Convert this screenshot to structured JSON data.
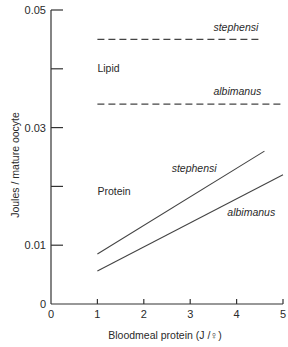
{
  "chart_data": {
    "type": "line",
    "title": "",
    "xlabel": "Bloodmeal protein (J /♀)",
    "ylabel": "Joules / mature oocyte",
    "xlim": [
      0,
      5
    ],
    "ylim": [
      0,
      0.05
    ],
    "x_ticks": [
      0,
      1,
      2,
      3,
      4,
      5
    ],
    "x_tick_labels": [
      "0",
      "1",
      "2",
      "3",
      "4",
      "5"
    ],
    "y_ticks": [
      0,
      0.01,
      0.02,
      0.03,
      0.04,
      0.05
    ],
    "y_tick_labels": [
      "0",
      "0.01",
      "",
      "0.03",
      "",
      "0.05"
    ],
    "grid": false,
    "legend": null,
    "series": [
      {
        "name": "Lipid - stephensi",
        "group": "Lipid",
        "species": "stephensi",
        "style": "dashed",
        "x": [
          1,
          4.5
        ],
        "values": [
          0.045,
          0.045
        ]
      },
      {
        "name": "Lipid - albimanus",
        "group": "Lipid",
        "species": "albimanus",
        "style": "dashed",
        "x": [
          1,
          5
        ],
        "values": [
          0.034,
          0.034
        ]
      },
      {
        "name": "Protein - stephensi",
        "group": "Protein",
        "species": "stephensi",
        "style": "solid",
        "x": [
          1,
          4.6
        ],
        "values": [
          0.0085,
          0.026
        ]
      },
      {
        "name": "Protein - albimanus",
        "group": "Protein",
        "species": "albimanus",
        "style": "solid",
        "x": [
          1,
          5
        ],
        "values": [
          0.0056,
          0.022
        ]
      }
    ],
    "annotations": [
      {
        "text": "stephensi",
        "italic": true,
        "x": 3.5,
        "y": 0.0465
      },
      {
        "text": "Lipid",
        "italic": false,
        "x": 1.0,
        "y": 0.0395
      },
      {
        "text": "albimanus",
        "italic": true,
        "x": 3.5,
        "y": 0.0355
      },
      {
        "text": "stephensi",
        "italic": true,
        "x": 2.6,
        "y": 0.0225
      },
      {
        "text": "Protein",
        "italic": false,
        "x": 1.0,
        "y": 0.0185
      },
      {
        "text": "albimanus",
        "italic": true,
        "x": 3.8,
        "y": 0.015
      }
    ]
  }
}
